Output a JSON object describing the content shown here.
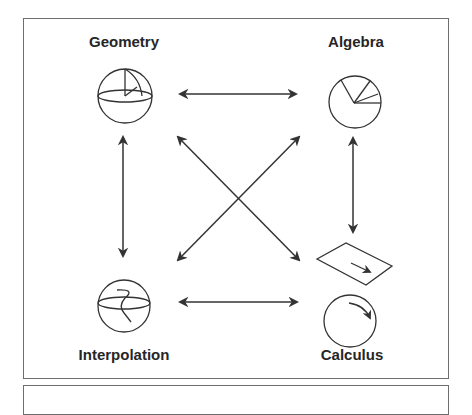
{
  "diagram": {
    "nodes": [
      {
        "id": "geometry",
        "label": "Geometry",
        "icon": "sphere-with-spherical-triangle-icon"
      },
      {
        "id": "algebra",
        "label": "Algebra",
        "icon": "pie-circle-icon"
      },
      {
        "id": "interpolation",
        "label": "Interpolation",
        "icon": "sphere-with-curve-icon"
      },
      {
        "id": "calculus",
        "label": "Calculus",
        "icon": "plane-and-circle-with-arrows-icon"
      }
    ],
    "edges": [
      {
        "from": "geometry",
        "to": "algebra",
        "type": "bidirectional"
      },
      {
        "from": "geometry",
        "to": "interpolation",
        "type": "bidirectional"
      },
      {
        "from": "algebra",
        "to": "calculus",
        "type": "bidirectional"
      },
      {
        "from": "interpolation",
        "to": "calculus",
        "type": "bidirectional"
      },
      {
        "from": "geometry",
        "to": "calculus",
        "type": "bidirectional"
      },
      {
        "from": "algebra",
        "to": "interpolation",
        "type": "bidirectional"
      }
    ],
    "colors": {
      "stroke": "#333333",
      "frame": "#6e6e6e",
      "text": "#262626"
    }
  }
}
